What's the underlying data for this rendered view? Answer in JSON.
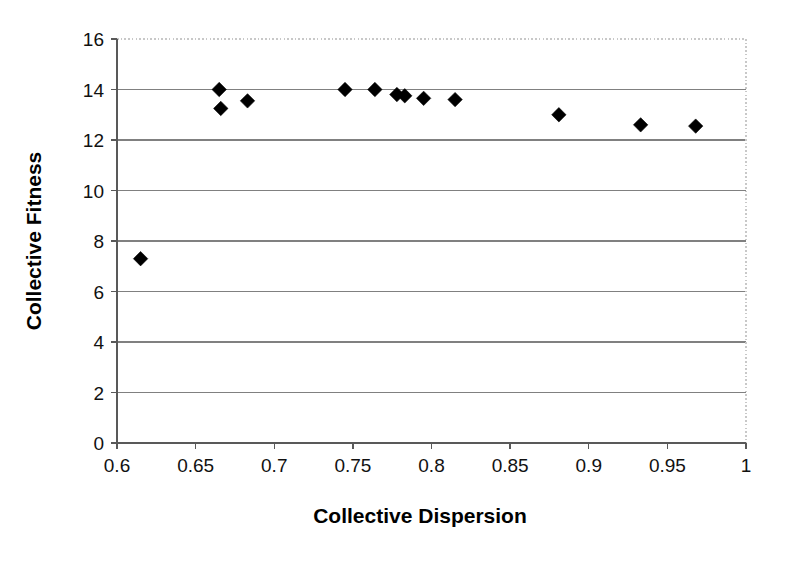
{
  "chart_data": {
    "type": "scatter",
    "title": "",
    "xlabel": "Collective Dispersion",
    "ylabel": "Collective Fitness",
    "xlim": [
      0.6,
      1
    ],
    "ylim": [
      0,
      16
    ],
    "xticks": [
      0.6,
      0.65,
      0.7,
      0.75,
      0.8,
      0.85,
      0.9,
      0.95,
      1
    ],
    "yticks": [
      0,
      2,
      4,
      6,
      8,
      10,
      12,
      14,
      16
    ],
    "xtick_labels": [
      "0.6",
      "0.65",
      "0.7",
      "0.75",
      "0.8",
      "0.85",
      "0.9",
      "0.95",
      "1"
    ],
    "ytick_labels": [
      "0",
      "2",
      "4",
      "6",
      "8",
      "10",
      "12",
      "14",
      "16"
    ],
    "grid": "horizontal",
    "legend": "none",
    "marker": "diamond",
    "marker_color": "#000000",
    "series": [
      {
        "name": "Collective Fitness vs Collective Dispersion",
        "points": [
          {
            "x": 0.615,
            "y": 7.3
          },
          {
            "x": 0.665,
            "y": 14.0
          },
          {
            "x": 0.666,
            "y": 13.25
          },
          {
            "x": 0.683,
            "y": 13.55
          },
          {
            "x": 0.745,
            "y": 14.0
          },
          {
            "x": 0.764,
            "y": 14.0
          },
          {
            "x": 0.778,
            "y": 13.8
          },
          {
            "x": 0.783,
            "y": 13.75
          },
          {
            "x": 0.795,
            "y": 13.65
          },
          {
            "x": 0.815,
            "y": 13.6
          },
          {
            "x": 0.881,
            "y": 13.0
          },
          {
            "x": 0.933,
            "y": 12.6
          },
          {
            "x": 0.968,
            "y": 12.55
          }
        ]
      }
    ]
  },
  "plot_area": {
    "left": 117,
    "right": 746,
    "top": 39,
    "bottom": 443
  },
  "style": {
    "background": "#ffffff",
    "gridline_color": "#808080",
    "axis_color": "#595959",
    "border_color": "#c8c8c8",
    "marker_color": "#000000"
  }
}
